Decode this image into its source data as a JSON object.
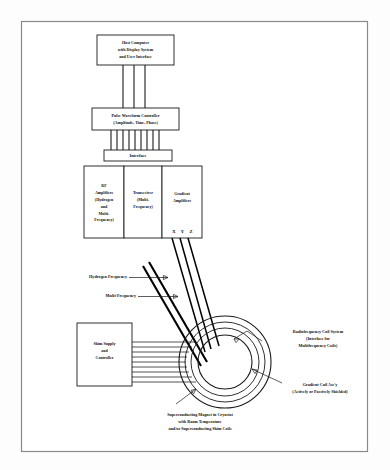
{
  "figure": {
    "frame_color": "#8a8a8a",
    "line_color": "#111111",
    "background": "#ffffff"
  },
  "blocks": {
    "host_computer": {
      "name": "host-computer",
      "lines": [
        "Host Computer",
        "with Display System",
        "and User Interface"
      ]
    },
    "pulse_controller": {
      "name": "pulse-waveform-controller",
      "lines": [
        "Pulse Waveform Controller",
        "(Amplitude, Time, Phase)"
      ]
    },
    "interface": {
      "name": "interface",
      "lines": [
        "Interface"
      ]
    },
    "rf_amplifiers": {
      "name": "rf-amplifiers",
      "lines": [
        "RF",
        "Amplifiers",
        "(Hydrogen",
        "and",
        "Multi-",
        "Frequency)"
      ]
    },
    "transceiver": {
      "name": "transceiver",
      "lines": [
        "Transceiver",
        "(Multi-",
        "Frequency)"
      ]
    },
    "gradient_amplifiers": {
      "name": "gradient-amplifiers",
      "lines": [
        "Gradient",
        "Amplifiers"
      ],
      "axes_label": "X  Y  Z"
    },
    "shim_supply": {
      "name": "shim-supply-and-controller",
      "lines": [
        "Shim Supply",
        "and",
        "Controller"
      ]
    }
  },
  "callouts": {
    "hydrogen_frequency": {
      "name": "hydrogen-frequency",
      "text": "Hydrogen Frequency"
    },
    "multifrequency": {
      "name": "multifrequency",
      "text": "Multi-Frequency"
    },
    "rf_coil_system": {
      "name": "radiofrequency-coil-system",
      "lines": [
        "Radiofrequency Coil System",
        "(Interface for",
        "Multifrequency Coils)"
      ]
    },
    "gradient_coil": {
      "name": "gradient-coil-assembly",
      "lines": [
        "Gradient Coil Ass'y",
        "(Actively or Passively Shielded)"
      ]
    },
    "magnet_caption": {
      "name": "superconducting-magnet-caption",
      "lines": [
        "Superconducting Magnet in Cryostat",
        "with Room Temperature",
        "and/or Superconducting Shim Coils"
      ]
    }
  },
  "connections": {
    "host_to_controller_count": 3,
    "controller_to_interface_count": 9,
    "shim_lines_count": 9,
    "gradient_lines_count": 3,
    "rf_lines_count": 2
  }
}
